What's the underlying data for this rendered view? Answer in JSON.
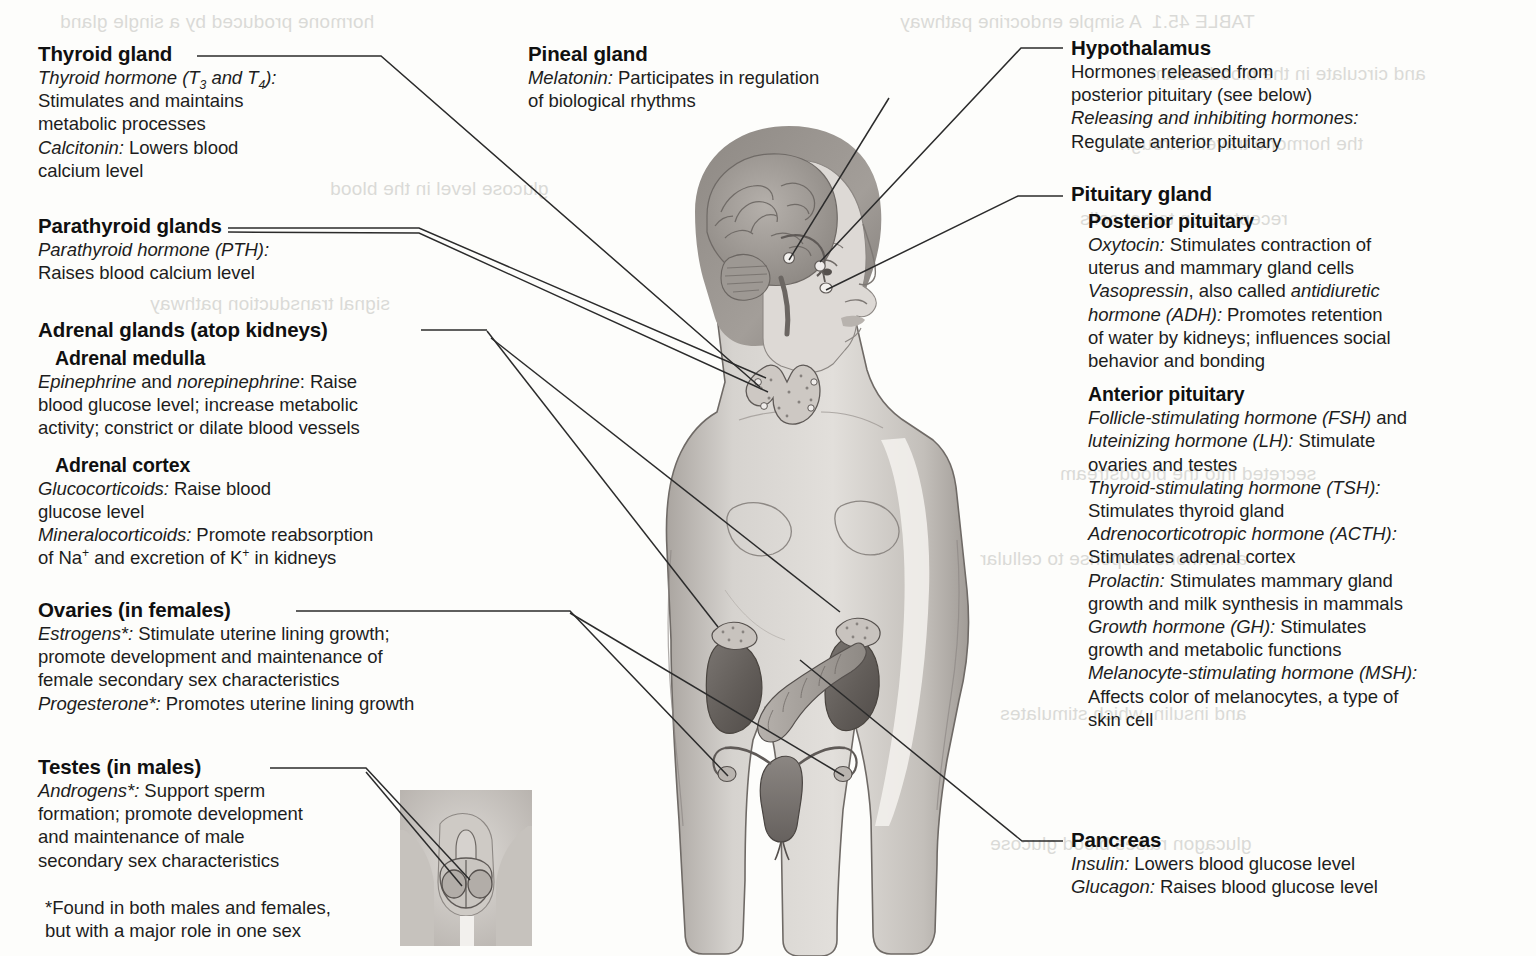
{
  "diagram": {
    "figure_caption": "Female human body showing locations of the endocrine glands, with a male inset for the testes"
  },
  "labels": {
    "thyroid": {
      "heading": "Thyroid gland",
      "lines": [
        {
          "em": "Thyroid hormone (T3 and T4):",
          "rest": ""
        },
        {
          "em": "",
          "rest": "Stimulates and maintains"
        },
        {
          "em": "",
          "rest": "metabolic processes"
        },
        {
          "em": "Calcitonin:",
          "rest": " Lowers blood"
        },
        {
          "em": "",
          "rest": "calcium level"
        }
      ]
    },
    "parathyroid": {
      "heading": "Parathyroid glands",
      "lines": [
        {
          "em": "Parathyroid hormone (PTH):",
          "rest": ""
        },
        {
          "em": "",
          "rest": "Raises blood calcium level"
        }
      ]
    },
    "adrenal": {
      "heading": "Adrenal glands (atop kidneys)",
      "medulla_heading": "Adrenal medulla",
      "medulla_lines": [
        {
          "em": "Epinephrine",
          "mid": " and ",
          "em2": "norepinephrine",
          "rest": ": Raise"
        },
        {
          "rest": "blood glucose level; increase metabolic"
        },
        {
          "rest": "activity; constrict or dilate blood vessels"
        }
      ],
      "cortex_heading": "Adrenal cortex",
      "cortex_lines": [
        {
          "em": "Glucocorticoids:",
          "rest": " Raise blood"
        },
        {
          "rest": "glucose level"
        },
        {
          "em": "Mineralocorticoids:",
          "rest": " Promote reabsorption"
        },
        {
          "rest_html": "of Na+ and excretion of K+ in kidneys"
        }
      ]
    },
    "ovaries": {
      "heading": "Ovaries (in females)",
      "lines": [
        {
          "em": "Estrogens*:",
          "rest": " Stimulate uterine lining growth;"
        },
        {
          "rest": "promote development and maintenance of"
        },
        {
          "rest": "female secondary sex characteristics"
        },
        {
          "em": "Progesterone*:",
          "rest": " Promotes uterine lining growth"
        }
      ]
    },
    "testes": {
      "heading": "Testes (in males)",
      "lines": [
        {
          "em": "Androgens*:",
          "rest": " Support sperm"
        },
        {
          "rest": "formation; promote development"
        },
        {
          "rest": "and maintenance of male"
        },
        {
          "rest": "secondary sex characteristics"
        }
      ]
    },
    "footnote": {
      "line1": "*Found in both males and females,",
      "line2": "but with a major role in one sex"
    },
    "pineal": {
      "heading": "Pineal gland",
      "lines": [
        {
          "em": "Melatonin:",
          "rest": " Participates in regulation"
        },
        {
          "rest": "of biological rhythms"
        }
      ]
    },
    "hypothalamus": {
      "heading": "Hypothalamus",
      "lines": [
        {
          "rest": "Hormones released from"
        },
        {
          "rest": "posterior pituitary (see below)"
        },
        {
          "em": "Releasing and inhibiting hormones:",
          "rest": ""
        },
        {
          "rest": "Regulate anterior pituitary"
        }
      ]
    },
    "pituitary": {
      "heading": "Pituitary gland",
      "posterior_heading": "Posterior pituitary",
      "posterior_lines": [
        {
          "em": "Oxytocin:",
          "rest": " Stimulates contraction of"
        },
        {
          "rest": "uterus and mammary gland cells"
        },
        {
          "em": "Vasopressin",
          "mid": ", also called ",
          "em2": "antidiuretic"
        },
        {
          "em": "hormone (ADH):",
          "rest": " Promotes retention"
        },
        {
          "rest": "of water by kidneys; influences social"
        },
        {
          "rest": "behavior and bonding"
        }
      ],
      "anterior_heading": "Anterior pituitary",
      "anterior_lines": [
        {
          "em": "Follicle-stimulating hormone (FSH)",
          "rest": " and"
        },
        {
          "em": "luteinizing hormone (LH):",
          "rest": " Stimulate"
        },
        {
          "rest": "ovaries and testes"
        },
        {
          "em": "Thyroid-stimulating hormone (TSH):",
          "rest": ""
        },
        {
          "rest": "Stimulates thyroid gland"
        },
        {
          "em": "Adrenocorticotropic hormone (ACTH):",
          "rest": ""
        },
        {
          "rest": "Stimulates adrenal cortex"
        },
        {
          "em": "Prolactin:",
          "rest": " Stimulates mammary gland"
        },
        {
          "rest": "growth and milk synthesis in mammals"
        },
        {
          "em": "Growth hormone (GH):",
          "rest": " Stimulates"
        },
        {
          "rest": "growth and metabolic functions"
        },
        {
          "em": "Melanocyte-stimulating hormone (MSH):",
          "rest": ""
        },
        {
          "rest": "Affects color of melanocytes, a type of"
        },
        {
          "rest": "skin cell"
        }
      ]
    },
    "pancreas": {
      "heading": "Pancreas",
      "lines": [
        {
          "em": "Insulin:",
          "rest": " Lowers blood glucose level"
        },
        {
          "em": "Glucagon:",
          "rest": " Raises blood glucose level"
        }
      ]
    }
  },
  "ghost_text": {
    "g1": "hormone produced by a single gland",
    "g2": "TABLE 45.1  A simple endocrine pathway",
    "g3": "and circulate in the bloodstream",
    "g4": "the hormone travels through",
    "g5": "glucose level in the blood",
    "g6": "receptors on target cells",
    "g7": "signal transduction pathway",
    "g8": "secreted into the bloodstream",
    "g9": "a hormone response to cellular",
    "g10": "and insulin, which stimulates",
    "g11": "glucagon raises blood glucose"
  },
  "colors": {
    "ink": "#1a1a1a",
    "paper": "#fdfdfb",
    "leader": "#2b2b2b",
    "skin_light": "#d9d6d2",
    "skin_mid": "#bdb9b4",
    "skin_dark": "#9b9691",
    "organ_dark": "#6f6a66",
    "organ_mid": "#8d8884",
    "ghost": "#b9b9b4"
  }
}
